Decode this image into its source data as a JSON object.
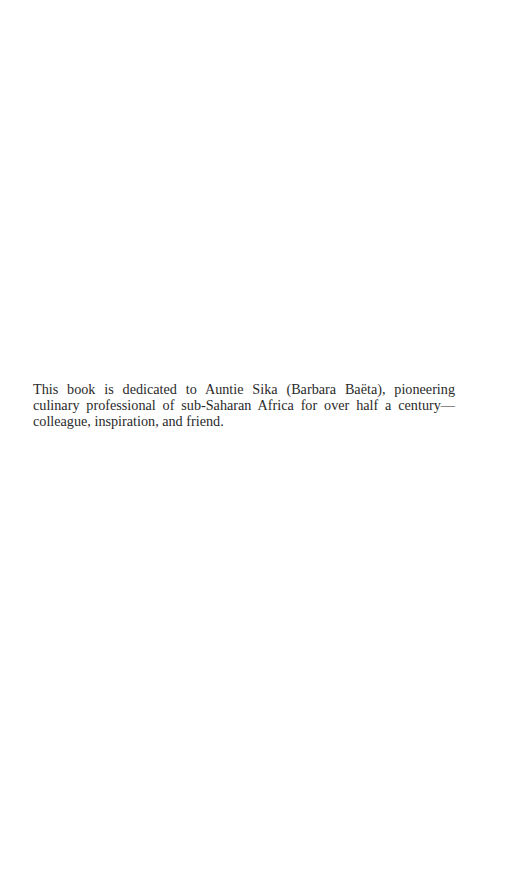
{
  "page": {
    "background_color": "#ffffff",
    "text_color": "#2a2a2a"
  },
  "dedication": {
    "full_text": "This book is dedicated to Auntie Sika (Barbara Baëta), pioneering culinary professional of sub-Saharan Africa for over half a century—colleague, inspiration, and friend.",
    "lines": [
      "This book is dedicated to Auntie Sika (Barbara Baëta), pioneering",
      "culinary professional of sub-Saharan Africa for over half a century—",
      "colleague, inspiration, and friend."
    ]
  }
}
